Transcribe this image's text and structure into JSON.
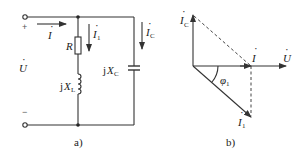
{
  "figure": {
    "panel_a": {
      "caption": "a)",
      "source": {
        "plus": "+",
        "minus": "−",
        "voltage_label": "U",
        "voltage_dot": "·"
      },
      "currents": {
        "total": {
          "symbol": "I",
          "dot": "·"
        },
        "branch1": {
          "symbol": "I",
          "sub": "1",
          "dot": "·"
        },
        "capacitor": {
          "symbol": "I",
          "sub": "C",
          "dot": "·"
        }
      },
      "components": {
        "resistor": {
          "label": "R"
        },
        "inductor": {
          "prefix": "j",
          "symbol": "X",
          "sub": "L"
        },
        "capacitor": {
          "prefix": "j",
          "symbol": "X",
          "sub": "C"
        }
      }
    },
    "panel_b": {
      "caption": "b)",
      "phasors": {
        "ic": {
          "symbol": "I",
          "sub": "C"
        },
        "i": {
          "symbol": "I"
        },
        "u": {
          "symbol": "U"
        },
        "i1": {
          "symbol": "I",
          "sub": "1"
        }
      },
      "angle": {
        "symbol": "φ",
        "sub": "1"
      }
    }
  }
}
